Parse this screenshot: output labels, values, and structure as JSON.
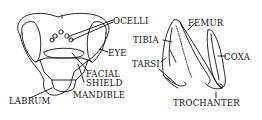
{
  "diagram": {
    "head": {
      "labels": {
        "ocelli": "OCELLI",
        "eye": "EYE",
        "facial_shield": "FACIAL\nSHIELD",
        "facial": "FACIAL",
        "shield": "SHIELD",
        "mandible": "MANDIBLE",
        "labrum": "LABRUM"
      }
    },
    "leg": {
      "labels": {
        "femur": "FEMUR",
        "tibia": "TIBIA",
        "tarsi": "TARSI",
        "coxa": "COXA",
        "trochanter": "TROCHANTER"
      }
    },
    "colors": {
      "ink": "#111111",
      "background": "#ffffff"
    }
  }
}
